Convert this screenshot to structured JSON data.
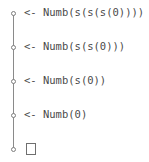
{
  "diagram": {
    "type": "vertical-chain",
    "background_color": "#ffffff",
    "line_color": "#8a8a8a",
    "node_color": "#7d7d7d",
    "text_color": "#4a4a4a",
    "nodes": [
      {
        "index": 0,
        "y": 13,
        "arrow": "<-",
        "label": "<- Numb(s(s(s(0))))",
        "kind": "labeled-node"
      },
      {
        "index": 1,
        "y": 47,
        "arrow": "<-",
        "label": "<- Numb(s(s(0)))",
        "kind": "labeled-node"
      },
      {
        "index": 2,
        "y": 81,
        "arrow": "<-",
        "label": "<- Numb(s(0))",
        "kind": "labeled-node"
      },
      {
        "index": 3,
        "y": 115,
        "arrow": "<-",
        "label": "<- Numb(0)",
        "kind": "labeled-node"
      },
      {
        "index": 4,
        "y": 149,
        "arrow": "",
        "label": "",
        "kind": "placeholder-node"
      }
    ]
  }
}
